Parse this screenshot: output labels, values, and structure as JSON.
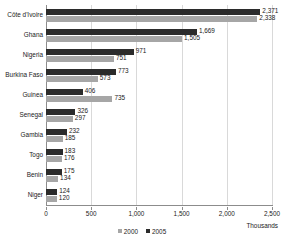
{
  "chart_data": {
    "type": "bar",
    "orientation": "horizontal",
    "title": "",
    "xlabel": "Thousands",
    "ylabel": "",
    "xlim": [
      0,
      2500
    ],
    "xticks": [
      "0",
      "500",
      "1,000",
      "1,500",
      "2,000",
      "2,500"
    ],
    "xtick_values": [
      0,
      500,
      1000,
      1500,
      2000,
      2500
    ],
    "grid": true,
    "legend_position": "bottom-center",
    "categories": [
      "Côte d'Ivoire",
      "Ghana",
      "Nigeria",
      "Burkina Faso",
      "Guinea",
      "Senegal",
      "Gambia",
      "Togo",
      "Benin",
      "Niger"
    ],
    "series": [
      {
        "name": "2005",
        "color": "#2b2b2b",
        "values": [
          2371,
          1669,
          971,
          773,
          406,
          326,
          232,
          183,
          175,
          124
        ],
        "labels": [
          "2,371",
          "1,669",
          "971",
          "773",
          "406",
          "326",
          "232",
          "183",
          "175",
          "124"
        ]
      },
      {
        "name": "2000",
        "color": "#a6a6a6",
        "values": [
          2338,
          1505,
          751,
          573,
          735,
          297,
          185,
          176,
          134,
          120
        ],
        "labels": [
          "2,338",
          "1,505",
          "751",
          "573",
          "735",
          "297",
          "185",
          "176",
          "134",
          "120"
        ]
      }
    ],
    "legend": [
      {
        "label": "2000",
        "color": "#a6a6a6"
      },
      {
        "label": "2005",
        "color": "#2b2b2b"
      }
    ]
  }
}
